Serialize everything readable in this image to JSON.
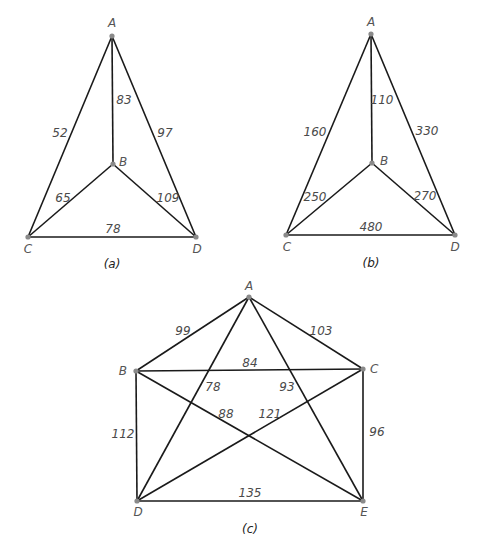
{
  "graphs": [
    {
      "id": "a",
      "caption": "(a)",
      "caption_pos": [
        112,
        268
      ],
      "vertices": [
        {
          "name": "A",
          "x": 112,
          "y": 36,
          "label_x": 112,
          "label_y": 27,
          "anchor": "middle"
        },
        {
          "name": "B",
          "x": 113,
          "y": 164,
          "label_x": 119,
          "label_y": 166,
          "anchor": "start"
        },
        {
          "name": "C",
          "x": 28,
          "y": 237,
          "label_x": 28,
          "label_y": 253,
          "anchor": "middle"
        },
        {
          "name": "D",
          "x": 196,
          "y": 237,
          "label_x": 197,
          "label_y": 253,
          "anchor": "middle"
        }
      ],
      "edges": [
        {
          "from": "A",
          "to": "C",
          "weight": "52",
          "lx": 60,
          "ly": 137
        },
        {
          "from": "A",
          "to": "B",
          "weight": "83",
          "lx": 124,
          "ly": 104
        },
        {
          "from": "A",
          "to": "D",
          "weight": "97",
          "lx": 165,
          "ly": 137
        },
        {
          "from": "B",
          "to": "C",
          "weight": "65",
          "lx": 63,
          "ly": 202
        },
        {
          "from": "B",
          "to": "D",
          "weight": "109",
          "lx": 168,
          "ly": 202
        },
        {
          "from": "C",
          "to": "D",
          "weight": "78",
          "lx": 113,
          "ly": 233
        }
      ]
    },
    {
      "id": "b",
      "caption": "(b)",
      "caption_pos": [
        371,
        267
      ],
      "vertices": [
        {
          "name": "A",
          "x": 371,
          "y": 34,
          "label_x": 371,
          "label_y": 26,
          "anchor": "middle"
        },
        {
          "name": "B",
          "x": 372,
          "y": 163,
          "label_x": 380,
          "label_y": 165,
          "anchor": "start"
        },
        {
          "name": "C",
          "x": 286,
          "y": 235,
          "label_x": 287,
          "label_y": 251,
          "anchor": "middle"
        },
        {
          "name": "D",
          "x": 455,
          "y": 235,
          "label_x": 455,
          "label_y": 251,
          "anchor": "middle"
        }
      ],
      "edges": [
        {
          "from": "A",
          "to": "C",
          "weight": "160",
          "lx": 315,
          "ly": 136
        },
        {
          "from": "A",
          "to": "B",
          "weight": "110",
          "lx": 382,
          "ly": 104
        },
        {
          "from": "A",
          "to": "D",
          "weight": "330",
          "lx": 427,
          "ly": 135
        },
        {
          "from": "B",
          "to": "C",
          "weight": "250",
          "lx": 315,
          "ly": 201
        },
        {
          "from": "B",
          "to": "D",
          "weight": "270",
          "lx": 425,
          "ly": 200
        },
        {
          "from": "C",
          "to": "D",
          "weight": "480",
          "lx": 371,
          "ly": 231
        }
      ]
    },
    {
      "id": "c",
      "caption": "(c)",
      "caption_pos": [
        250,
        533
      ],
      "vertices": [
        {
          "name": "A",
          "x": 249,
          "y": 297,
          "label_x": 249,
          "label_y": 290,
          "anchor": "middle"
        },
        {
          "name": "B",
          "x": 136,
          "y": 371,
          "label_x": 127,
          "label_y": 375,
          "anchor": "end"
        },
        {
          "name": "C",
          "x": 363,
          "y": 369,
          "label_x": 370,
          "label_y": 373,
          "anchor": "start"
        },
        {
          "name": "D",
          "x": 137,
          "y": 501,
          "label_x": 138,
          "label_y": 516,
          "anchor": "middle"
        },
        {
          "name": "E",
          "x": 363,
          "y": 501,
          "label_x": 364,
          "label_y": 516,
          "anchor": "middle"
        }
      ],
      "edges": [
        {
          "from": "A",
          "to": "B",
          "weight": "99",
          "lx": 183,
          "ly": 335
        },
        {
          "from": "A",
          "to": "C",
          "weight": "103",
          "lx": 321,
          "ly": 335
        },
        {
          "from": "B",
          "to": "C",
          "weight": "84",
          "lx": 250,
          "ly": 367
        },
        {
          "from": "A",
          "to": "D",
          "weight": "78",
          "lx": 213,
          "ly": 391
        },
        {
          "from": "A",
          "to": "E",
          "weight": "93",
          "lx": 287,
          "ly": 391
        },
        {
          "from": "B",
          "to": "E",
          "weight": "88",
          "lx": 226,
          "ly": 418
        },
        {
          "from": "C",
          "to": "D",
          "weight": "121",
          "lx": 270,
          "ly": 418
        },
        {
          "from": "B",
          "to": "D",
          "weight": "112",
          "lx": 123,
          "ly": 438
        },
        {
          "from": "C",
          "to": "E",
          "weight": "96",
          "lx": 377,
          "ly": 436
        },
        {
          "from": "D",
          "to": "E",
          "weight": "135",
          "lx": 250,
          "ly": 497
        }
      ]
    }
  ],
  "colors": {
    "edge": "#1a1a1a",
    "vertex": "#8a8a8a",
    "text": "#4a4a4a"
  }
}
